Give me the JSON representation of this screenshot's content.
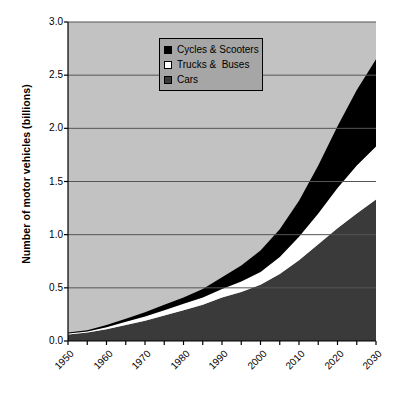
{
  "chart_data": {
    "type": "area",
    "stacked": true,
    "title": "",
    "xlabel": "",
    "ylabel": "Number of motor vehicles (billions)",
    "x": [
      1950,
      1955,
      1960,
      1965,
      1970,
      1975,
      1980,
      1985,
      1990,
      1995,
      2000,
      2005,
      2010,
      2015,
      2020,
      2025,
      2030
    ],
    "xlim": [
      1950,
      2030
    ],
    "ylim": [
      0.0,
      3.0
    ],
    "yticks": [
      "0.0",
      "0.5",
      "1.0",
      "1.5",
      "2.0",
      "2.5",
      "3.0"
    ],
    "ytick_values": [
      0.0,
      0.5,
      1.0,
      1.5,
      2.0,
      2.5,
      3.0
    ],
    "xticks": [
      "1950",
      "1960",
      "1970",
      "1980",
      "1990",
      "2000",
      "2010",
      "2020",
      "2030"
    ],
    "xtick_values": [
      1950,
      1960,
      1970,
      1980,
      1990,
      2000,
      2010,
      2020,
      2030
    ],
    "xtick_minor_step": 5,
    "grid": "horizontal",
    "legend_position": "top-center",
    "plot_background": "#c2c2c2",
    "series": [
      {
        "name": "Cars",
        "color": "#3a3a3a",
        "order": 0,
        "values": [
          0.06,
          0.08,
          0.11,
          0.15,
          0.19,
          0.24,
          0.29,
          0.34,
          0.41,
          0.46,
          0.53,
          0.63,
          0.76,
          0.91,
          1.06,
          1.2,
          1.33
        ]
      },
      {
        "name": "Trucks &  Buses",
        "color": "#ffffff",
        "order": 1,
        "values": [
          0.01,
          0.01,
          0.02,
          0.03,
          0.04,
          0.05,
          0.06,
          0.07,
          0.08,
          0.1,
          0.12,
          0.16,
          0.22,
          0.29,
          0.38,
          0.45,
          0.5
        ]
      },
      {
        "name": "Cycles & Scooters",
        "color": "#000000",
        "order": 2,
        "values": [
          0.01,
          0.01,
          0.02,
          0.03,
          0.04,
          0.05,
          0.06,
          0.08,
          0.11,
          0.15,
          0.2,
          0.26,
          0.34,
          0.45,
          0.58,
          0.71,
          0.82
        ]
      }
    ],
    "totals": [
      0.08,
      0.1,
      0.15,
      0.21,
      0.27,
      0.34,
      0.41,
      0.49,
      0.6,
      0.71,
      0.85,
      1.05,
      1.32,
      1.65,
      2.02,
      2.36,
      2.65
    ]
  },
  "legend": {
    "items": [
      {
        "label": "Cycles & Scooters",
        "swatch_color": "#000000",
        "swatch_name": "legend-swatch-cycles"
      },
      {
        "label": "Trucks &  Buses",
        "swatch_color": "#ffffff",
        "swatch_name": "legend-swatch-trucks"
      },
      {
        "label": "Cars",
        "swatch_color": "#3a3a3a",
        "swatch_name": "legend-swatch-cars"
      }
    ]
  },
  "axes": {
    "y_title": "Number of motor vehicles (billions)"
  }
}
